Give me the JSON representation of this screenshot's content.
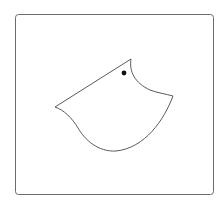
{
  "diagram": {
    "colors": {
      "background": "#ffffff",
      "frame_stroke": "#6b6b6b",
      "shape_stroke": "#5a5a5a",
      "shape_fill": "#ffffff",
      "eye_fill": "#111111"
    },
    "frame": {
      "x": 15.5,
      "y": 14.5,
      "width": 198,
      "height": 180,
      "corner_radius": 3
    },
    "shape": {
      "points": {
        "top_tip": [
          131,
          59
        ],
        "right_point": [
          173,
          96
        ],
        "bottom": [
          116,
          151
        ],
        "left_point": [
          55,
          107
        ]
      }
    },
    "eye": {
      "cx": 124,
      "cy": 73,
      "r": 2.4
    }
  }
}
